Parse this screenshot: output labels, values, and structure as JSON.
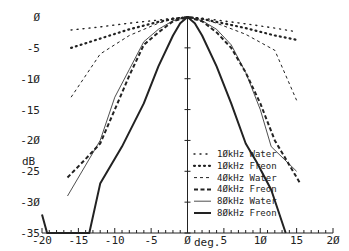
{
  "chart_data": {
    "type": "line",
    "title": "",
    "xlabel": "deg.",
    "ylabel": "dB",
    "xlim": [
      -20,
      20
    ],
    "ylim": [
      -35,
      0
    ],
    "x_ticks": [
      -20,
      -15,
      -10,
      -5,
      0,
      5,
      10,
      15,
      20
    ],
    "x_tick_labels": [
      "-20",
      "-15",
      "-10",
      "-5",
      "Ø",
      "5",
      "1Ø",
      "15",
      "2Ø"
    ],
    "y_ticks": [
      0,
      -5,
      -10,
      -15,
      -20,
      -25,
      -30,
      -35
    ],
    "y_tick_labels": [
      "Ø",
      "-5",
      "-1Ø",
      "-15",
      "-2Ø",
      "-25",
      "-3Ø",
      "-35"
    ],
    "grid": false,
    "legend_position": "lower right",
    "series": [
      {
        "name": "1ØkHz Water",
        "style": "sparse-dotted",
        "x": [
          -16,
          -12,
          -8,
          -4,
          -2,
          0,
          2,
          4,
          8,
          12,
          15
        ],
        "y": [
          -2.1,
          -1.6,
          -1.0,
          -0.5,
          -0.2,
          0,
          -0.2,
          -0.5,
          -1.1,
          -1.8,
          -2.4
        ]
      },
      {
        "name": "1ØkHz Freon",
        "style": "dotted",
        "x": [
          -16,
          -12,
          -8,
          -4,
          -2,
          0,
          2,
          4,
          8,
          12,
          15
        ],
        "y": [
          -5.0,
          -3.5,
          -2.0,
          -0.8,
          -0.3,
          0,
          -0.3,
          -0.8,
          -1.8,
          -3.0,
          -3.7
        ]
      },
      {
        "name": "4ØkHz Water",
        "style": "dashed",
        "x": [
          -16,
          -12,
          -8,
          -4,
          -2,
          0,
          2,
          4,
          8,
          12,
          15
        ],
        "y": [
          -13,
          -6,
          -3,
          -1,
          -0.3,
          0,
          -0.3,
          -1,
          -2.8,
          -5.4,
          -13.5
        ]
      },
      {
        "name": "4ØkHz Freon",
        "style": "bold-dashed",
        "x": [
          -16.5,
          -14,
          -12,
          -10,
          -8,
          -6,
          -4,
          -2,
          0,
          2,
          4,
          6,
          8,
          10,
          12,
          15.5
        ],
        "y": [
          -26,
          -23,
          -20.5,
          -15,
          -9.5,
          -4.5,
          -2.5,
          -0.7,
          0,
          -0.7,
          -2.5,
          -5,
          -9,
          -14,
          -20,
          -27
        ]
      },
      {
        "name": "8ØkHz Water",
        "style": "thin-solid",
        "x": [
          -16.5,
          -14,
          -12,
          -10,
          -8,
          -6,
          -4,
          -2,
          0,
          2,
          4,
          6,
          8,
          10,
          11.5,
          15
        ],
        "y": [
          -29,
          -24,
          -20,
          -13,
          -8.5,
          -4,
          -2,
          -0.6,
          0,
          -0.6,
          -2,
          -4.5,
          -9,
          -15,
          -21,
          -25
        ]
      },
      {
        "name": "8ØkHz Freon",
        "style": "bold-solid",
        "x": [
          -20,
          -19.3,
          -13.5,
          -12,
          -9,
          -6,
          -4,
          -2,
          -1,
          0,
          1,
          2,
          4,
          6,
          8,
          9.5,
          11.5,
          13.5
        ],
        "y": [
          -32,
          -35,
          -35,
          -27,
          -21,
          -14,
          -8,
          -3,
          -1,
          0,
          -1,
          -3,
          -8,
          -14,
          -20.5,
          -23.5,
          -28,
          -35
        ]
      }
    ]
  }
}
